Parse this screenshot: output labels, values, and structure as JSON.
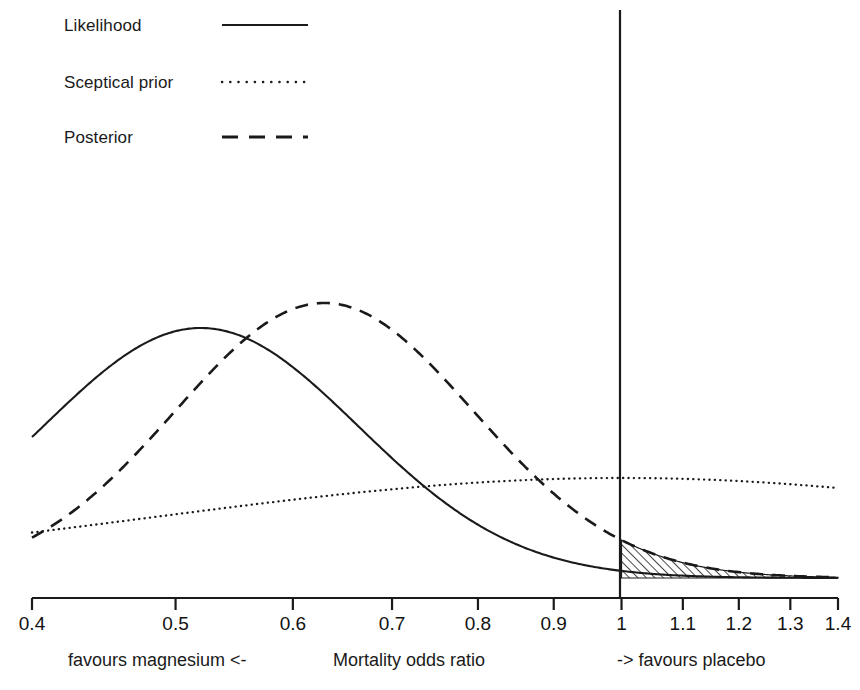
{
  "chart_data": {
    "type": "line",
    "title": "",
    "xlabel": "Mortality odds ratio",
    "ylabel": "",
    "xscale": "log",
    "xlim": [
      0.4,
      1.4
    ],
    "grid": false,
    "legend_position": "top-left",
    "reference_line": {
      "x": 1,
      "label": "null effect (OR = 1)"
    },
    "shaded_region": {
      "series": "Posterior",
      "from": 1,
      "to": 1.4,
      "style": "hatched",
      "description": "Posterior probability that the odds ratio favours placebo"
    },
    "axis_ticks": [
      {
        "label": "0.4",
        "value": 0.4
      },
      {
        "label": "0.5",
        "value": 0.5
      },
      {
        "label": "0.6",
        "value": 0.6
      },
      {
        "label": "0.7",
        "value": 0.7
      },
      {
        "label": "0.8",
        "value": 0.8
      },
      {
        "label": "0.9",
        "value": 0.9
      },
      {
        "label": "1",
        "value": 1.0
      },
      {
        "label": "1.1",
        "value": 1.1
      },
      {
        "label": "1.2",
        "value": 1.2
      },
      {
        "label": "1.3",
        "value": 1.3
      },
      {
        "label": "1.4",
        "value": 1.4
      }
    ],
    "series": [
      {
        "name": "Likelihood",
        "style": "solid",
        "color": "#1a1a1a",
        "mode": "lognormal-density",
        "mode_or": 0.52,
        "log_mean": -0.6539,
        "log_sd": 0.245,
        "peak_height": 1.0
      },
      {
        "name": "Sceptical prior",
        "style": "dotted",
        "color": "#1a1a1a",
        "mode": "lognormal-density",
        "mode_or": 1.0,
        "log_mean": 0.0,
        "log_sd": 0.73,
        "peak_height": 0.4
      },
      {
        "name": "Posterior",
        "style": "dashed",
        "color": "#1a1a1a",
        "mode": "lognormal-density",
        "mode_or": 0.63,
        "log_mean": -0.462,
        "log_sd": 0.232,
        "peak_height": 1.1
      }
    ]
  },
  "legend": {
    "items": [
      {
        "label": "Likelihood",
        "style": "solid"
      },
      {
        "label": "Sceptical prior",
        "style": "dotted"
      },
      {
        "label": "Posterior",
        "style": "dashed"
      }
    ]
  },
  "captions": {
    "left": "favours magnesium <-",
    "center": "Mortality odds ratio",
    "right": "-> favours placebo"
  }
}
